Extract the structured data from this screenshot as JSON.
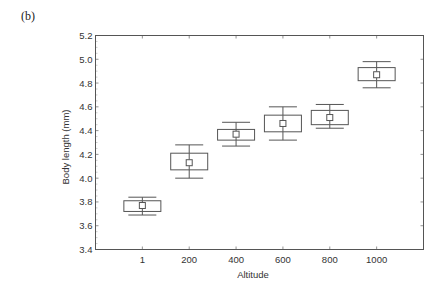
{
  "panel_label": "(b)",
  "chart_data": {
    "type": "box",
    "title": "",
    "xlabel": "Altitude",
    "ylabel": "Body length (mm)",
    "categories": [
      "1",
      "200",
      "400",
      "600",
      "800",
      "1000"
    ],
    "ylim": [
      3.4,
      5.2
    ],
    "yticks": [
      "3.4",
      "3.6",
      "3.8",
      "4.0",
      "4.2",
      "4.4",
      "4.6",
      "4.8",
      "5.0",
      "5.2"
    ],
    "grid": false,
    "legend": null,
    "series": [
      {
        "name": "Body length",
        "center": [
          3.77,
          4.13,
          4.37,
          4.46,
          4.51,
          4.87
        ],
        "box_low": [
          3.72,
          4.07,
          4.32,
          4.39,
          4.45,
          4.82
        ],
        "box_high": [
          3.81,
          4.21,
          4.41,
          4.53,
          4.57,
          4.93
        ],
        "whisker_low": [
          3.69,
          4.0,
          4.27,
          4.32,
          4.42,
          4.76
        ],
        "whisker_high": [
          3.84,
          4.28,
          4.47,
          4.6,
          4.62,
          4.98
        ]
      }
    ],
    "colors": {
      "stroke": "#555555",
      "box_fill": "#ffffff",
      "text": "#333333"
    }
  }
}
